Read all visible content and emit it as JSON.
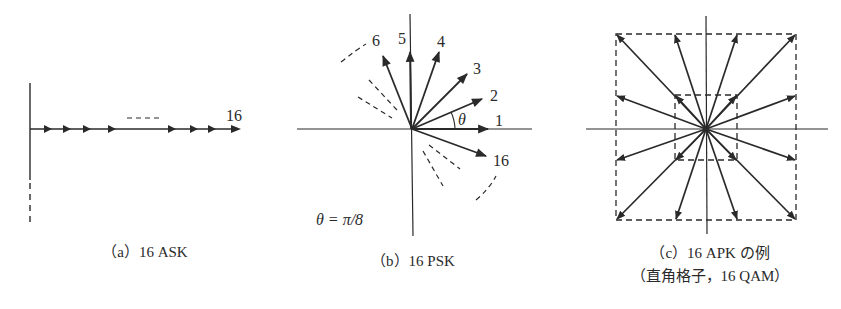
{
  "figure": {
    "panels": [
      {
        "id": "a",
        "caption": "（a）16 ASK",
        "labels": {
          "last_point": "16",
          "ellipsis": "----"
        }
      },
      {
        "id": "b",
        "caption": "（b）16 PSK",
        "labels": {
          "p1": "1",
          "p2": "2",
          "p3": "3",
          "p4": "4",
          "p5": "5",
          "p6": "6",
          "p16": "16",
          "theta": "θ",
          "theta_def": "θ = π/8"
        }
      },
      {
        "id": "c",
        "caption_line1": "（c）16 APK の例",
        "caption_line2": "（直角格子，16 QAM）"
      }
    ],
    "colors": {
      "ink": "#2a2a2a",
      "background": "#ffffff"
    }
  }
}
